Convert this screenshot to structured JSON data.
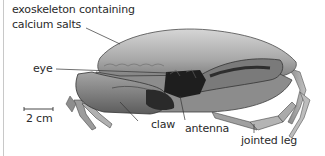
{
  "diagram": {
    "labels": {
      "exoskeleton_line1": "exoskeleton containing",
      "exoskeleton_line2": "calcium salts",
      "eye": "eye",
      "claw": "claw",
      "antenna": "antenna",
      "jointed_leg": "jointed leg"
    },
    "scale_bar": {
      "label": "2 cm"
    },
    "colors": {
      "shell_light": "#c9c9c9",
      "shell_mid": "#9a9a9a",
      "shell_dark": "#555555",
      "mouth_dark": "#1e1e1e",
      "leader_line": "#333333",
      "frame": "#c8c8c8"
    }
  }
}
